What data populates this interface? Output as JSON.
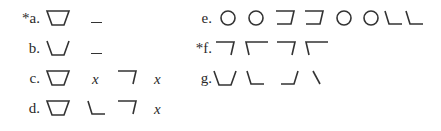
{
  "items": [
    {
      "id": "a",
      "label": "*a.",
      "starred": true,
      "tokens": [
        "trapezoid-inverted",
        "blank"
      ]
    },
    {
      "id": "b",
      "label": "b.",
      "starred": false,
      "tokens": [
        "cup-open",
        "blank"
      ]
    },
    {
      "id": "c",
      "label": "c.",
      "starred": false,
      "tokens": [
        "trapezoid-inverted",
        "x",
        "hook-right-down",
        "x"
      ]
    },
    {
      "id": "d",
      "label": "d.",
      "starred": false,
      "tokens": [
        "trapezoid-inverted",
        "corner-bottom-left",
        "hook-right-down",
        "x"
      ]
    },
    {
      "id": "e",
      "label": "e.",
      "starred": false,
      "tokens": [
        "circle",
        "circle",
        "bracket-right-open",
        "bracket-right-open",
        "circle",
        "circle",
        "corner-bottom-left",
        "corner-bottom-left"
      ]
    },
    {
      "id": "f",
      "label": "*f.",
      "starred": true,
      "tokens": [
        "hook-right-down",
        "hook-left-down",
        "hook-right-down",
        "hook-left-down"
      ]
    },
    {
      "id": "g",
      "label": "g.",
      "starred": false,
      "tokens": [
        "cup-open",
        "corner-bottom-left",
        "corner-bottom-right-slant",
        "backslash-stroke"
      ]
    }
  ],
  "variable_symbol": "x",
  "colors": {
    "ink": "#333333",
    "background": "#ffffff"
  }
}
